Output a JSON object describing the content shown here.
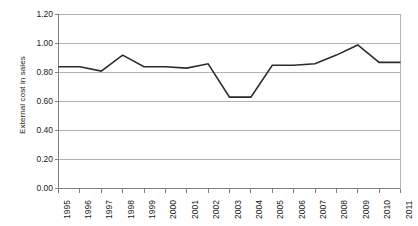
{
  "chart_data": {
    "type": "line",
    "title": "",
    "xlabel": "",
    "ylabel": "External cost in sales",
    "ylim": [
      0.0,
      1.2
    ],
    "ytick_values": [
      0.0,
      0.2,
      0.4,
      0.6,
      0.8,
      1.0,
      1.2
    ],
    "ytick_labels": [
      "0.00",
      "0.20",
      "0.40",
      "0.60",
      "0.80",
      "1.00",
      "1.20"
    ],
    "grid": true,
    "grid_axis": "y",
    "legend": false,
    "legend_position": "none",
    "line_color": "#2b2b2b",
    "grid_color": "#b3b3b3",
    "axis_color": "#808080",
    "categories": [
      "1995",
      "1996",
      "1997",
      "1998",
      "1999",
      "2000",
      "2001",
      "2002",
      "2003",
      "2004",
      "2005",
      "2006",
      "2007",
      "2008",
      "2009",
      "2010",
      "2011"
    ],
    "x": [
      1995,
      1996,
      1997,
      1998,
      1999,
      2000,
      2001,
      2002,
      2003,
      2004,
      2005,
      2006,
      2007,
      2008,
      2009,
      2010,
      2011
    ],
    "values": [
      0.84,
      0.84,
      0.81,
      0.92,
      0.84,
      0.84,
      0.83,
      0.86,
      0.63,
      0.63,
      0.85,
      0.85,
      0.86,
      0.92,
      0.99,
      0.87,
      0.87
    ],
    "series": [
      {
        "name": "External cost in sales",
        "values": [
          0.84,
          0.84,
          0.81,
          0.92,
          0.84,
          0.84,
          0.83,
          0.86,
          0.63,
          0.63,
          0.85,
          0.85,
          0.86,
          0.92,
          0.99,
          0.87,
          0.87
        ]
      }
    ]
  },
  "axis": {
    "y_title": "External cost in sales"
  }
}
